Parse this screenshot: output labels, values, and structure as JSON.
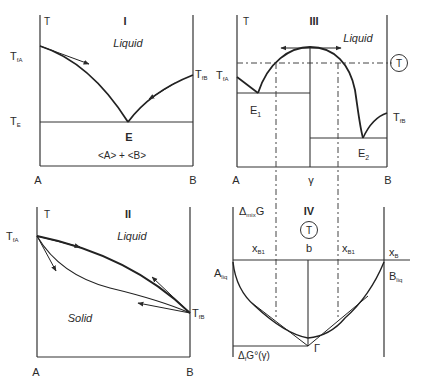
{
  "panels": {
    "I": {
      "numeral": "I",
      "axis_t": "T",
      "region_liquid": "Liquid",
      "t_fa": "T",
      "t_fa_sub": "fA",
      "t_fb": "T",
      "t_fb_sub": "fB",
      "t_e": "T",
      "t_e_sub": "E",
      "eutectic": "E",
      "solid_phases": "<A> + <B>",
      "x_a": "A",
      "x_b": "B"
    },
    "II": {
      "numeral": "II",
      "axis_t": "T",
      "region_liquid": "Liquid",
      "region_solid": "Solid",
      "t_fa": "T",
      "t_fa_sub": "fA",
      "t_fb": "T",
      "t_fb_sub": "fB",
      "x_a": "A",
      "x_b": "B"
    },
    "III": {
      "numeral": "III",
      "axis_t": "T",
      "region_liquid": "Liquid",
      "circled_t": "T",
      "t_fa": "T",
      "t_fa_sub": "fA",
      "t_fb": "T",
      "t_fb_sub": "fB",
      "e1": "E",
      "e1_sub": "1",
      "e2": "E",
      "e2_sub": "2",
      "x_a": "A",
      "x_gamma": "γ",
      "x_b": "B"
    },
    "IV": {
      "numeral": "IV",
      "axis": "Δ",
      "axis_sub": "mix",
      "axis_tail": "G",
      "circled_t": "T",
      "xb1_left": "x",
      "xb1_left_sub": "B1",
      "b": "b",
      "xb1_right": "x",
      "xb1_right_sub": "B1",
      "xb": "x",
      "xb_sub": "B",
      "a_liq": "A",
      "a_liq_sub": "liq",
      "b_liq": "B",
      "b_liq_sub": "liq",
      "gamma_point": "Γ",
      "formation": "Δ",
      "formation_sub": "f",
      "formation_tail": "G°(γ)"
    }
  }
}
